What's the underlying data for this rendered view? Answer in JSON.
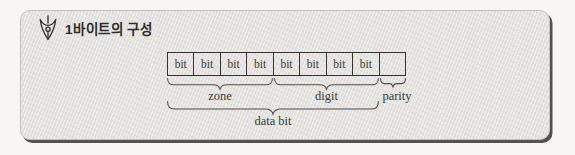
{
  "panel": {
    "title": "1바이트의 구성",
    "title_icon": "pen-nib-icon"
  },
  "diagram": {
    "cells": [
      "bit",
      "bit",
      "bit",
      "bit",
      "bit",
      "bit",
      "bit",
      "bit",
      ""
    ],
    "groups": [
      {
        "label": "zone",
        "cells": "1-4"
      },
      {
        "label": "digit",
        "cells": "5-8"
      },
      {
        "label": "parity",
        "cells": "9"
      },
      {
        "label": "data bit",
        "cells": "1-8"
      }
    ]
  },
  "colors": {
    "page_background": "#f7f6f3",
    "panel_background": "#e3e2de",
    "panel_shadow": "#54524c",
    "line": "#33322d",
    "text": "#3b3a33"
  }
}
